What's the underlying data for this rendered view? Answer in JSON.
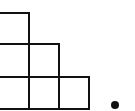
{
  "diagram": {
    "type": "staircase-young-diagram",
    "cell_size": 31,
    "stroke_color": "#111111",
    "background": "#ffffff",
    "rows": [
      {
        "row": 1,
        "cells": 1
      },
      {
        "row": 2,
        "cells": 2
      },
      {
        "row": 3,
        "cells": 3
      }
    ],
    "cells": [
      {
        "x": -3,
        "y": 12,
        "w": 33,
        "h": 33
      },
      {
        "x": -3,
        "y": 43,
        "w": 33,
        "h": 35
      },
      {
        "x": 28,
        "y": 43,
        "w": 32,
        "h": 35
      },
      {
        "x": -3,
        "y": 76,
        "w": 33,
        "h": 34
      },
      {
        "x": 28,
        "y": 76,
        "w": 32,
        "h": 34
      },
      {
        "x": 58,
        "y": 76,
        "w": 32,
        "h": 34
      }
    ],
    "dot": {
      "cx": 115,
      "cy": 105,
      "r": 4,
      "color": "#111111"
    }
  }
}
